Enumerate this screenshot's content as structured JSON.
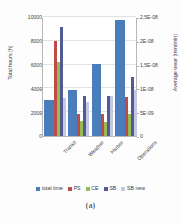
{
  "chart_data": {
    "type": "bar",
    "title": "",
    "caption": "(a)",
    "categories": [
      "Transit",
      "Weather",
      "Harbor",
      "Operations"
    ],
    "xlabel": "",
    "ylabel": "Total hours [h]",
    "ylabel_secondary": "Average wear [mm/min]",
    "ylim": [
      0,
      10000
    ],
    "ylim_secondary": [
      0,
      2.5e-08
    ],
    "grid": true,
    "legend_position": "bottom",
    "yticks": [
      0,
      2000,
      4000,
      6000,
      8000,
      10000
    ],
    "ytick_labels": [
      "0",
      "2000",
      "4000",
      "6000",
      "8000",
      "10000"
    ],
    "yticks_secondary": [
      0,
      5e-09,
      1e-08,
      1.5e-08,
      2e-08,
      2.5e-08
    ],
    "ytick_labels_secondary": [
      "0",
      "5E-09",
      "1E-08",
      "1,5E-08",
      "2E-08",
      "2,5E-08"
    ],
    "series": [
      {
        "name": "total time",
        "axis": "left",
        "unit": "h",
        "color": "#4A7EBB",
        "values": [
          3000,
          3900,
          6050,
          9750
        ]
      },
      {
        "name": "PS",
        "axis": "right",
        "unit": "mm/min",
        "color": "#BE4B48",
        "values": [
          2e-08,
          4.7e-09,
          4.6e-09,
          8.2e-09
        ]
      },
      {
        "name": "CE",
        "axis": "right",
        "unit": "mm/min",
        "color": "#98B954",
        "values": [
          1.55e-08,
          3.1e-09,
          3e-09,
          4.7e-09
        ]
      },
      {
        "name": "SB",
        "axis": "right",
        "unit": "mm/min",
        "color": "#4F5B92",
        "values": [
          2.29e-08,
          8.5e-09,
          8.5e-09,
          1.24e-08
        ]
      },
      {
        "name": "SB new",
        "axis": "right",
        "unit": "mm/min",
        "color": "#C3C8E4",
        "values": [
          8e-09,
          7.2e-09,
          8.5e-09,
          9.6e-09
        ]
      }
    ]
  },
  "legend": {
    "items": [
      {
        "label": "total time",
        "color": "#4A7EBB"
      },
      {
        "label": "PS",
        "color": "#BE4B48"
      },
      {
        "label": "CE",
        "color": "#98B954"
      },
      {
        "label": "SB",
        "color": "#4F5B92"
      },
      {
        "label": "SB new",
        "color": "#C3C8E4"
      }
    ]
  },
  "caption": {
    "text": "(a)"
  }
}
